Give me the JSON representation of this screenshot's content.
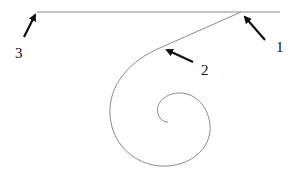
{
  "diagram": {
    "colors": {
      "curve": "#8a8a8a",
      "arrow": "#111111",
      "background": "#ffffff"
    },
    "labels": [
      {
        "id": "1",
        "text": "1",
        "points_to": "junction of horizontal line and tangent line"
      },
      {
        "id": "2",
        "text": "2",
        "points_to": "start of spiral on tangent line"
      },
      {
        "id": "3",
        "text": "3",
        "points_to": "left end of horizontal line"
      }
    ]
  }
}
